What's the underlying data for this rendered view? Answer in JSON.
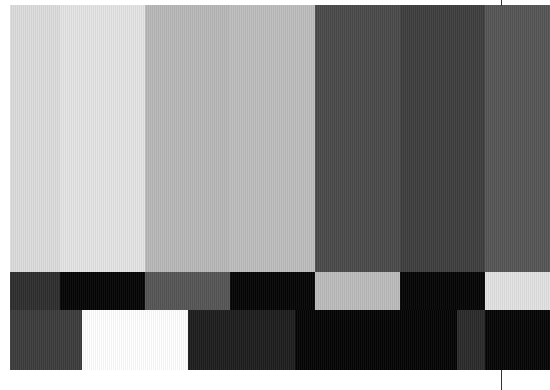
{
  "test_pattern": {
    "type": "grayscale-color-bars",
    "top_row": [
      {
        "width": 50,
        "color": "#dcdcdc"
      },
      {
        "width": 85,
        "color": "#e4e4e4"
      },
      {
        "width": 85,
        "color": "#b8b8b8"
      },
      {
        "width": 85,
        "color": "#bdbdbd"
      },
      {
        "width": 85,
        "color": "#4a4a4a"
      },
      {
        "width": 85,
        "color": "#3e3e3e"
      },
      {
        "width": 65,
        "color": "#555555"
      }
    ],
    "middle_row": [
      {
        "width": 50,
        "color": "#2e2e2e"
      },
      {
        "width": 85,
        "color": "#050505"
      },
      {
        "width": 85,
        "color": "#555555"
      },
      {
        "width": 85,
        "color": "#050505"
      },
      {
        "width": 85,
        "color": "#bcbcbc"
      },
      {
        "width": 85,
        "color": "#050505"
      },
      {
        "width": 65,
        "color": "#e2e2e2"
      }
    ],
    "bottom_row": [
      {
        "width": 72,
        "color": "#3c3c3c"
      },
      {
        "width": 106,
        "color": "#ffffff"
      },
      {
        "width": 107,
        "color": "#1e1e1e"
      },
      {
        "width": 162,
        "color": "#040404"
      },
      {
        "width": 28,
        "color": "#2a2a2a"
      },
      {
        "width": 65,
        "color": "#050505"
      }
    ]
  }
}
